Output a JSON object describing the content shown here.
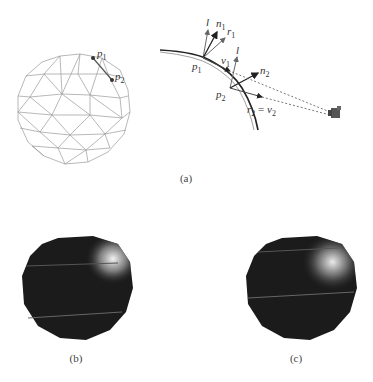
{
  "figure": {
    "panels": [
      {
        "id": "a",
        "caption": "(a)",
        "description": "Triangle mesh sphere with vertices p1, p2 and reflection geometry diagram"
      },
      {
        "id": "b",
        "caption": "(b)",
        "description": "Rendered dark sphere with specular highlight"
      },
      {
        "id": "c",
        "caption": "(c)",
        "description": "Rendered dark sphere with specular highlight"
      }
    ],
    "mesh_labels": {
      "p1": "p",
      "p1_sub": "1",
      "p2": "p",
      "p2_sub": "2"
    },
    "diagram_labels": {
      "l1": "l",
      "n1": "n",
      "n1_sub": "1",
      "r1": "r",
      "r1_sub": "1",
      "v1": "v",
      "v1_sub": "1",
      "p1": "p",
      "p1_sub": "1",
      "l2": "l",
      "n2": "n",
      "n2_sub": "2",
      "p2": "p",
      "p2_sub": "2",
      "r2_eq_v2": "r",
      "r2_sub": "2",
      "eq": " = ",
      "v2": "v",
      "v2_sub": "2"
    },
    "icons": {
      "camera": "camera-icon"
    },
    "colors": {
      "mesh": "#9a9a9a",
      "arrow_dark": "#222222",
      "arrow_gray": "#666666",
      "sphere": "#1b1b1b",
      "highlight": "#e8e8e8"
    }
  }
}
